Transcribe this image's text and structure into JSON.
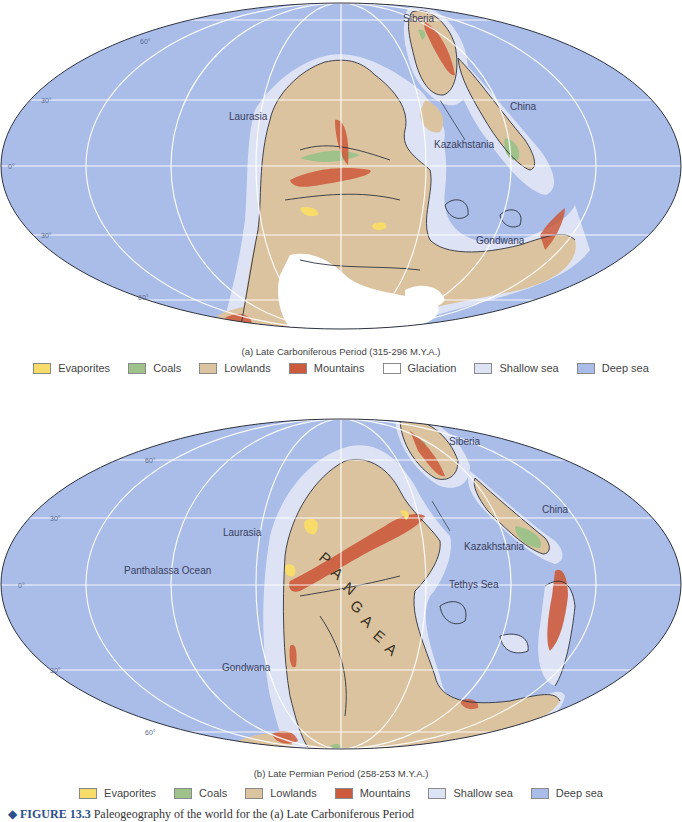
{
  "colors": {
    "deep_sea": "#a9bde8",
    "shallow_sea": "#dde3f5",
    "lowlands": "#dcc4a0",
    "mountains": "#cc5a3c",
    "coals": "#9fc28a",
    "evaporites": "#f7dc6a",
    "glaciation": "#ffffff",
    "coastline": "#2f3340",
    "graticule": "#ffffff"
  },
  "map_a": {
    "caption": "(a)  Late Carboniferous Period (315-296 M.Y.A.)",
    "labels": {
      "siberia": "Siberia",
      "laurasia": "Laurasia",
      "china": "China",
      "kazakhstania": "Kazakhstania",
      "gondwana": "Gondwana"
    },
    "latitudes": {
      "n60": "60°",
      "n30": "30°",
      "eq": "0°",
      "s30": "30°",
      "s60": "60°"
    },
    "legend": [
      {
        "key": "evaporites",
        "label": "Evaporites"
      },
      {
        "key": "coals",
        "label": "Coals"
      },
      {
        "key": "lowlands",
        "label": "Lowlands"
      },
      {
        "key": "mountains",
        "label": "Mountains"
      },
      {
        "key": "glaciation",
        "label": "Glaciation"
      },
      {
        "key": "shallow_sea",
        "label": "Shallow sea"
      },
      {
        "key": "deep_sea",
        "label": "Deep sea"
      }
    ]
  },
  "map_b": {
    "caption": "(b)  Late Permian Period (258-253 M.Y.A.)",
    "labels": {
      "siberia": "Siberia",
      "laurasia": "Laurasia",
      "china": "China",
      "kazakhstania": "Kazakhstania",
      "panthalassa": "Panthalassa Ocean",
      "tethys": "Tethys Sea",
      "gondwana": "Gondwana",
      "pangaea": [
        "P",
        "A",
        "N",
        "G",
        "A",
        "E",
        "A"
      ]
    },
    "latitudes": {
      "n60": "60°",
      "n30": "30°",
      "eq": "0°",
      "s30": "30°",
      "s60": "60°"
    },
    "legend": [
      {
        "key": "evaporites",
        "label": "Evaporites"
      },
      {
        "key": "coals",
        "label": "Coals"
      },
      {
        "key": "lowlands",
        "label": "Lowlands"
      },
      {
        "key": "mountains",
        "label": "Mountains"
      },
      {
        "key": "shallow_sea",
        "label": "Shallow sea"
      },
      {
        "key": "deep_sea",
        "label": "Deep sea"
      }
    ]
  },
  "figure_caption": {
    "number": "FIGURE 13.3",
    "text": "Paleogeography of the world for the (a) Late Carboniferous Period"
  }
}
